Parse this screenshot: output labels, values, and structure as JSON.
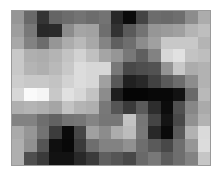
{
  "chart_data": {
    "type": "heatmap",
    "title": "",
    "xlabel": "",
    "ylabel": "",
    "colormap": "grayscale",
    "value_range": [
      0,
      255
    ],
    "n_rows": 12,
    "n_cols": 16,
    "grid": false,
    "legend": "none",
    "values": [
      [
        150,
        105,
        52,
        100,
        108,
        115,
        108,
        115,
        40,
        10,
        68,
        108,
        105,
        110,
        140,
        172
      ],
      [
        158,
        120,
        40,
        42,
        140,
        165,
        162,
        110,
        50,
        90,
        115,
        150,
        155,
        160,
        180,
        190
      ],
      [
        168,
        130,
        108,
        150,
        172,
        185,
        168,
        132,
        95,
        110,
        140,
        160,
        200,
        200,
        200,
        180
      ],
      [
        200,
        175,
        172,
        180,
        195,
        210,
        192,
        165,
        150,
        120,
        95,
        130,
        215,
        225,
        195,
        190
      ],
      [
        200,
        180,
        175,
        185,
        200,
        220,
        215,
        215,
        120,
        72,
        78,
        82,
        148,
        200,
        172,
        178
      ],
      [
        205,
        200,
        200,
        195,
        210,
        220,
        215,
        160,
        88,
        32,
        40,
        65,
        90,
        108,
        140,
        178
      ],
      [
        215,
        250,
        245,
        200,
        225,
        215,
        195,
        140,
        30,
        5,
        5,
        8,
        8,
        18,
        105,
        185
      ],
      [
        175,
        180,
        175,
        165,
        195,
        180,
        175,
        120,
        85,
        58,
        90,
        45,
        12,
        80,
        135,
        170
      ],
      [
        130,
        130,
        110,
        98,
        115,
        118,
        132,
        118,
        118,
        195,
        118,
        68,
        20,
        72,
        145,
        178
      ],
      [
        170,
        150,
        115,
        60,
        10,
        70,
        160,
        140,
        172,
        188,
        120,
        40,
        10,
        90,
        178,
        218
      ],
      [
        175,
        145,
        85,
        15,
        8,
        58,
        110,
        130,
        130,
        145,
        110,
        90,
        72,
        110,
        150,
        220
      ],
      [
        175,
        78,
        58,
        18,
        18,
        40,
        58,
        95,
        85,
        72,
        105,
        120,
        92,
        110,
        130,
        198
      ]
    ]
  },
  "colors": {
    "background": "#ffffff",
    "border": "#9a9a9a"
  }
}
